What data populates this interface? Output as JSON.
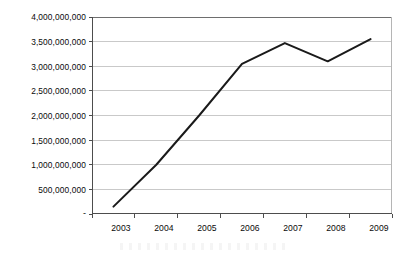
{
  "chart_data": {
    "type": "line",
    "title": "",
    "subtitle": "",
    "xlabel": "",
    "ylabel": "",
    "categories": [
      "2003",
      "2004",
      "2005",
      "2006",
      "2007",
      "2008",
      "2009"
    ],
    "series": [
      {
        "name": "Value",
        "values": [
          150000000,
          1000000000,
          2000000000,
          3050000000,
          3470000000,
          3100000000,
          3550000000
        ],
        "color": "#1a1a1a",
        "line_width": 2.0,
        "markers": false
      }
    ],
    "x": [
      "2003",
      "2004",
      "2005",
      "2006",
      "2007",
      "2008",
      "2009"
    ],
    "ylim": [
      0,
      4000000000
    ],
    "y_ticks": [
      0,
      500000000,
      1000000000,
      1500000000,
      2000000000,
      2500000000,
      3000000000,
      3500000000,
      4000000000
    ],
    "y_tick_labels": [
      "-",
      "500,000,000",
      "1,000,000,000",
      "1,500,000,000",
      "2,000,000,000",
      "2,500,000,000",
      "3,000,000,000",
      "3,500,000,000",
      "4,000,000,000"
    ],
    "x_tick_labels": [
      "2003",
      "2004",
      "2005",
      "2006",
      "2007",
      "2008",
      "2009"
    ],
    "grid": {
      "horizontal": true,
      "vertical": false,
      "color": "#c9c9c9"
    },
    "legend": {
      "visible": false,
      "position": "none",
      "entries": []
    },
    "axis": {
      "line_color": "#4d4d4d",
      "tick_color": "#4d4d4d",
      "plot_border": true,
      "plot_border_color": "#b5b5b5"
    },
    "background_color": "#ffffff"
  }
}
